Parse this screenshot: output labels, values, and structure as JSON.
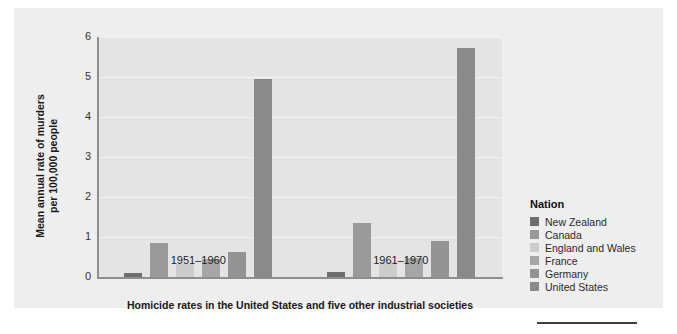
{
  "chart_data": {
    "type": "bar",
    "title": "",
    "caption": "Homicide rates in the United States and five other industrial societies",
    "xlabel": "",
    "ylabel": "Mean annual rate of murders\nper 100,000 people",
    "ylabel_line1": "Mean annual rate of murders",
    "ylabel_line2": "per 100,000 people",
    "categories": [
      "1951–1960",
      "1961–1970"
    ],
    "ylim": [
      0,
      6
    ],
    "yticks": [
      "0",
      "1",
      "2",
      "3",
      "4",
      "5",
      "6"
    ],
    "grid": true,
    "legend_position": "right",
    "legend_title": "Nation",
    "series": [
      {
        "name": "New Zealand",
        "values": [
          0.1,
          0.12
        ],
        "color": "#6e6e6e"
      },
      {
        "name": "Canada",
        "values": [
          0.85,
          1.35
        ],
        "color": "#9a9a9a"
      },
      {
        "name": "England and Wales",
        "values": [
          0.32,
          0.37
        ],
        "color": "#cccccc"
      },
      {
        "name": "France",
        "values": [
          0.45,
          0.48
        ],
        "color": "#a6a6a6"
      },
      {
        "name": "Germany",
        "values": [
          0.62,
          0.9
        ],
        "color": "#939393"
      },
      {
        "name": "United States",
        "values": [
          4.95,
          5.72
        ],
        "color": "#8a8a8a"
      }
    ]
  },
  "colors": {
    "panel_background": "#eeeeee",
    "plot_background": "#e4e4e4",
    "gridline": "#f3f3f3",
    "axis": "#8e8e8e",
    "text": "#1a1a1a",
    "rule": "#3d3d3d"
  }
}
